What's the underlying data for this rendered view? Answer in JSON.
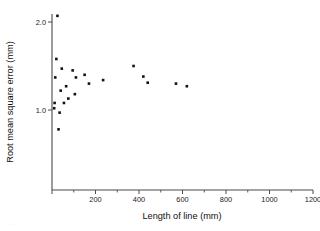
{
  "chart_data": {
    "type": "scatter",
    "title": "",
    "xlabel": "Length of line   (mm)",
    "ylabel": "Root mean square error  (mm)",
    "xlim": [
      0,
      1200
    ],
    "ylim": [
      0.0,
      2.28
    ],
    "grid": false,
    "legend": null,
    "x_ticks": [
      0,
      200,
      400,
      600,
      800,
      1000,
      1200
    ],
    "x_tick_labels": [
      "",
      "200",
      "400",
      "600",
      "800",
      "1000",
      "1200"
    ],
    "x_minor_ticks": [
      100,
      300,
      500,
      700,
      900,
      1100
    ],
    "y_ticks": [
      1.0,
      2.0
    ],
    "y_tick_labels": [
      "1.0",
      "2.0"
    ],
    "marker": "square",
    "marker_color": "#111111",
    "marker_size_px": 2.6,
    "points": [
      {
        "x": 25,
        "y": 2.07
      },
      {
        "x": 20,
        "y": 1.58
      },
      {
        "x": 45,
        "y": 1.47
      },
      {
        "x": 15,
        "y": 1.37
      },
      {
        "x": 95,
        "y": 1.45
      },
      {
        "x": 65,
        "y": 1.27
      },
      {
        "x": 110,
        "y": 1.37
      },
      {
        "x": 150,
        "y": 1.4
      },
      {
        "x": 105,
        "y": 1.18
      },
      {
        "x": 170,
        "y": 1.3
      },
      {
        "x": 235,
        "y": 1.34
      },
      {
        "x": 375,
        "y": 1.5
      },
      {
        "x": 420,
        "y": 1.38
      },
      {
        "x": 440,
        "y": 1.31
      },
      {
        "x": 570,
        "y": 1.3
      },
      {
        "x": 620,
        "y": 1.27
      },
      {
        "x": 12,
        "y": 1.08
      },
      {
        "x": 10,
        "y": 1.02
      },
      {
        "x": 55,
        "y": 1.08
      },
      {
        "x": 35,
        "y": 0.97
      },
      {
        "x": 40,
        "y": 1.22
      },
      {
        "x": 75,
        "y": 1.13
      },
      {
        "x": 30,
        "y": 0.78
      }
    ]
  },
  "figure": {
    "background": "#ffffff",
    "axis_color": "#4a4a4a",
    "text_color": "#111111",
    "scan_artifact": "·  ··  ··"
  }
}
